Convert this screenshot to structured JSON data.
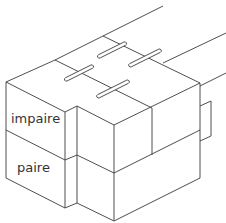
{
  "diagram": {
    "type": "isometric-block-stack",
    "labels": {
      "upper_course": "impaire",
      "lower_course": "paire"
    },
    "colors": {
      "stroke": "#3a3a3a",
      "background": "#ffffff",
      "label_text": "#333333"
    },
    "slot_count": 4
  }
}
